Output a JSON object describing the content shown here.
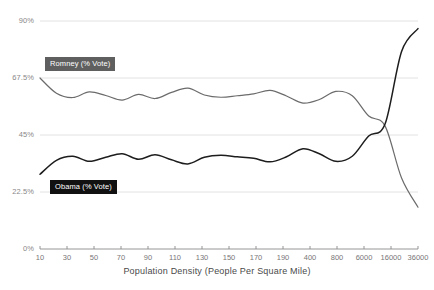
{
  "chart_data": {
    "type": "line",
    "title": "",
    "xlabel": "Population Density (People Per Square Mile)",
    "ylabel": "",
    "grid": true,
    "legend_position": "inline-annotation",
    "x_tick_labels": [
      "10",
      "30",
      "50",
      "70",
      "90",
      "110",
      "130",
      "150",
      "170",
      "190",
      "400",
      "800",
      "6000",
      "16000",
      "36000"
    ],
    "y_tick_labels": [
      "0%",
      "22.5%",
      "45%",
      "67.5%",
      "90%"
    ],
    "ylim": [
      0,
      90
    ],
    "y_ticks": [
      0,
      22.5,
      45,
      67.5,
      90
    ],
    "x_scale": "ordinal-binned",
    "series": [
      {
        "name": "Romney (% Vote)",
        "color": "#6b6b6b",
        "label_background": "#5f5f5f",
        "x": [
          10,
          20,
          30,
          40,
          50,
          60,
          70,
          80,
          90,
          100,
          110,
          120,
          130,
          140,
          150,
          160,
          170,
          180,
          190,
          400,
          800,
          6000,
          16000,
          36000
        ],
        "values": [
          67.5,
          61.5,
          59.8,
          62.0,
          60.6,
          58.8,
          61.0,
          59.4,
          61.8,
          63.5,
          60.8,
          59.9,
          60.5,
          61.2,
          62.6,
          60.4,
          57.6,
          59.0,
          62.2,
          60.5,
          52.5,
          48.5,
          28.0,
          16.5
        ]
      },
      {
        "name": "Obama (% Vote)",
        "color": "#1d1d1d",
        "label_background": "#111111",
        "x": [
          10,
          20,
          30,
          40,
          50,
          60,
          70,
          80,
          90,
          100,
          110,
          120,
          130,
          140,
          150,
          160,
          170,
          180,
          190,
          400,
          800,
          6000,
          16000,
          36000
        ],
        "values": [
          29.5,
          35.0,
          36.6,
          34.6,
          36.2,
          37.6,
          35.4,
          37.2,
          35.2,
          33.6,
          36.2,
          37.0,
          36.4,
          35.8,
          34.4,
          36.4,
          39.6,
          37.6,
          34.6,
          36.6,
          44.6,
          49.4,
          78.0,
          87.0
        ]
      }
    ],
    "annotations": [
      {
        "text": "Romney (% Vote)",
        "at_x": 10,
        "at_y": 67.5
      },
      {
        "text": "Obama (% Vote)",
        "at_x": 10,
        "at_y": 29.5
      }
    ]
  },
  "axis": {
    "y": {
      "t0": "0%",
      "t1": "22.5%",
      "t2": "45%",
      "t3": "67.5%",
      "t4": "90%"
    },
    "x": {
      "title": "Population Density (People Per Square Mile)",
      "t0": "10",
      "t1": "30",
      "t2": "50",
      "t3": "70",
      "t4": "90",
      "t5": "110",
      "t6": "130",
      "t7": "150",
      "t8": "170",
      "t9": "190",
      "t10": "400",
      "t11": "800",
      "t12": "6000",
      "t13": "16000",
      "t14": "36000"
    }
  },
  "legend": {
    "romney": "Romney (% Vote)",
    "obama": "Obama (% Vote)"
  }
}
